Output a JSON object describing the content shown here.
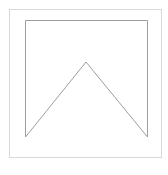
{
  "canvas": {
    "width": 168,
    "height": 175,
    "background_color": "#ffffff",
    "title": "Pennant outline line drawing"
  },
  "outer_frame": {
    "name": "outer-border-rectangle",
    "x": 9.5,
    "y": 9.5,
    "width": 152,
    "height": 148,
    "stroke_color": "#d9d9d9",
    "stroke_width": 1,
    "fill": "none"
  },
  "pennant": {
    "name": "pennant-outline-shape",
    "description": "Open rectangle with left, top and right sides, closed at the bottom by an inverted-V chevron rising to a central apex",
    "stroke_color": "#9e9e9e",
    "stroke_width": 1,
    "fill": "none",
    "left_x": 25.5,
    "right_x": 147.5,
    "top_y": 20.5,
    "baseline_y": 137,
    "apex_x": 86,
    "apex_y": 62,
    "points": [
      {
        "label": "bottom-left",
        "x": 25.5,
        "y": 137
      },
      {
        "label": "top-left",
        "x": 25.5,
        "y": 20.5
      },
      {
        "label": "top-right",
        "x": 147.5,
        "y": 20.5
      },
      {
        "label": "bottom-right",
        "x": 147.5,
        "y": 137
      },
      {
        "label": "apex",
        "x": 86,
        "y": 62
      }
    ]
  }
}
